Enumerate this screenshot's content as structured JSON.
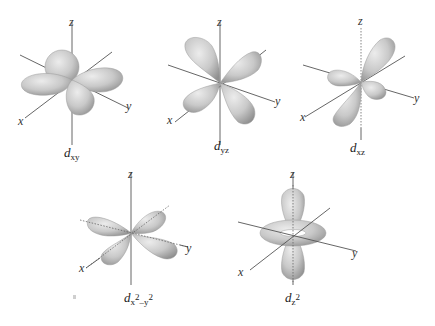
{
  "figure": {
    "background": "#ffffff",
    "lobe_color": "#c8c8c8",
    "axis_color": "#555555"
  },
  "axes": {
    "x": "x",
    "y": "y",
    "z": "z"
  },
  "orbitals": [
    {
      "id": "dxy",
      "base": "d",
      "sub": "xy",
      "sup1": "",
      "mid": "",
      "sup2": ""
    },
    {
      "id": "dyz",
      "base": "d",
      "sub": "yz",
      "sup1": "",
      "mid": "",
      "sup2": ""
    },
    {
      "id": "dxz",
      "base": "d",
      "sub": "xz",
      "sup1": "",
      "mid": "",
      "sup2": ""
    },
    {
      "id": "dx2-y2",
      "base": "d",
      "sub": "x",
      "sup1": "2",
      "mid": "–y",
      "sup2": "2"
    },
    {
      "id": "dz2",
      "base": "d",
      "sub": "z",
      "sup1": "2",
      "mid": "",
      "sup2": ""
    }
  ]
}
